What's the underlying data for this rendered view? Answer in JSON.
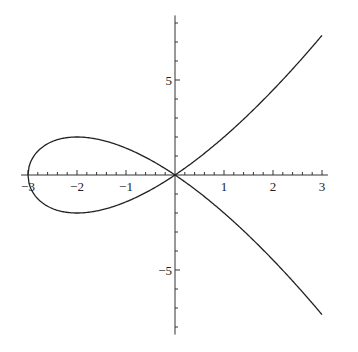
{
  "chart_data": {
    "type": "line",
    "title": "",
    "xlabel": "",
    "ylabel": "",
    "equation": "y^2 = x^2 (x + 3)",
    "xlim": [
      -3.1,
      3.1
    ],
    "ylim": [
      -8.4,
      8.4
    ],
    "grid": false,
    "legend": null,
    "x_ticks": [
      -3,
      -2,
      -1,
      1,
      2,
      3
    ],
    "x_tick_labels": [
      "−3",
      "−2",
      "−1",
      "1",
      "2",
      "3"
    ],
    "y_ticks": [
      5,
      -5
    ],
    "y_tick_labels": [
      "5",
      "−5"
    ],
    "series": [
      {
        "name": "curve",
        "color": "#222222",
        "x": [
          -3,
          -2.75,
          -2.5,
          -2,
          -1.5,
          -1,
          -0.5,
          0,
          0.5,
          1,
          1.5,
          2,
          2.5,
          3
        ],
        "y_upper": [
          0,
          -1.38,
          -1.77,
          -2.0,
          -1.84,
          -1.41,
          -0.79,
          0,
          0.94,
          2.0,
          3.18,
          4.47,
          5.86,
          7.35
        ],
        "y_lower": [
          0,
          1.38,
          1.77,
          2.0,
          1.84,
          1.41,
          0.79,
          0,
          -0.94,
          -2.0,
          -3.18,
          -4.47,
          -5.86,
          -7.35
        ]
      }
    ]
  }
}
